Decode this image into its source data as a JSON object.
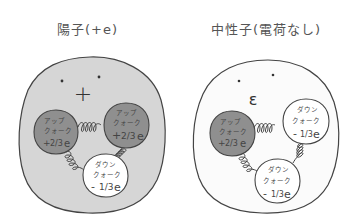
{
  "proton": {
    "title": "陽子(+e)",
    "face_symbol": "+",
    "fill_color": "#d6d6d6",
    "quarks": [
      {
        "type": "up",
        "label_line1": "アップ",
        "label_line2": "クォーク",
        "charge_sign": "+",
        "charge_frac": "2/3",
        "charge_unit": "e",
        "fill_color": "#8f8f8f"
      },
      {
        "type": "up",
        "label_line1": "アップ",
        "label_line2": "クォーク",
        "charge_sign": "+",
        "charge_frac": "2/3",
        "charge_unit": "e",
        "fill_color": "#8f8f8f"
      },
      {
        "type": "down",
        "label_line1": "ダウン",
        "label_line2": "クォーク",
        "charge_sign": "-",
        "charge_frac": "1/3",
        "charge_unit": "e",
        "fill_color": "#ffffff"
      }
    ]
  },
  "neutron": {
    "title": "中性子(電荷なし)",
    "face_symbol": "ε",
    "fill_color": "#fbfbfb",
    "quarks": [
      {
        "type": "up",
        "label_line1": "アップ",
        "label_line2": "クォーク",
        "charge_sign": "+",
        "charge_frac": "2/3",
        "charge_unit": "e",
        "fill_color": "#8f8f8f"
      },
      {
        "type": "down",
        "label_line1": "ダウン",
        "label_line2": "クォーク",
        "charge_sign": "-",
        "charge_frac": "1/3",
        "charge_unit": "e",
        "fill_color": "#ffffff"
      },
      {
        "type": "down",
        "label_line1": "ダウン",
        "label_line2": "クォーク",
        "charge_sign": "-",
        "charge_frac": "1/3",
        "charge_unit": "e",
        "fill_color": "#ffffff"
      }
    ]
  },
  "colors": {
    "outline": "#444444",
    "proton_body": "#d6d6d6",
    "neutron_body": "#fbfbfb",
    "up_quark": "#8f8f8f",
    "down_quark": "#ffffff"
  }
}
